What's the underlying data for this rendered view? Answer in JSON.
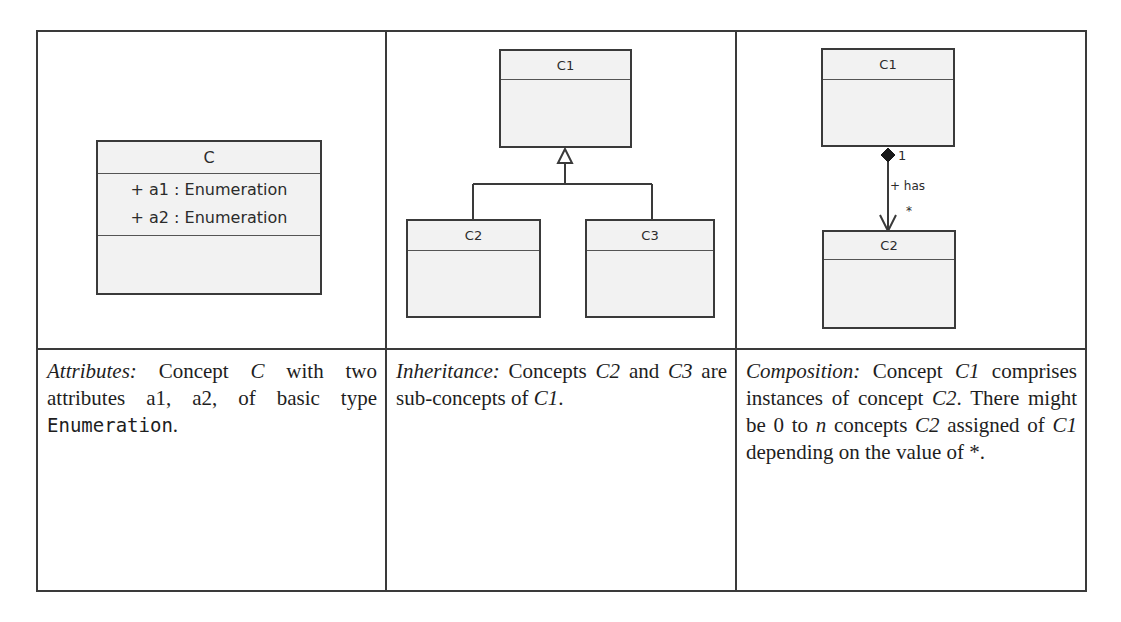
{
  "columns": [
    {
      "diagram": {
        "class": {
          "name": "C",
          "attributes": [
            "+ a1 : Enumeration",
            "+ a2 : Enumeration"
          ]
        }
      },
      "description": {
        "term": "Attributes:",
        "text_1": " Concept ",
        "c": "C",
        "text_2": " with two attributes a1, a2, of basic type ",
        "type": "Enumeration",
        "text_3": "."
      }
    },
    {
      "diagram": {
        "parent": "C1",
        "children": [
          "C2",
          "C3"
        ],
        "relation": "generalization"
      },
      "description": {
        "term": "Inheritance:",
        "text_1": " Concepts ",
        "c2": "C2",
        "text_2": " and ",
        "c3": "C3",
        "text_3": " are sub-concepts of ",
        "c1": "C1",
        "text_4": "."
      }
    },
    {
      "diagram": {
        "whole": "C1",
        "part": "C2",
        "relation": "composition",
        "role": "+ has",
        "multiplicity_whole": "1",
        "multiplicity_part": "*"
      },
      "description": {
        "term": "Composition:",
        "text_1": " Concept ",
        "c1a": "C1",
        "text_2": " comprises instances of concept ",
        "c2a": "C2",
        "text_3": ". There might be 0 to ",
        "n": "n",
        "text_4": " concepts ",
        "c2b": "C2",
        "text_5": " assigned of ",
        "c1b": "C1",
        "text_6": " depending on the value of *."
      }
    }
  ]
}
